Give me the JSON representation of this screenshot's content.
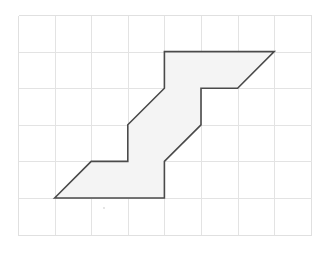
{
  "figure": {
    "canvas": {
      "width": 328,
      "height": 263,
      "background": "#ffffff"
    },
    "grid": {
      "origin_x": 18,
      "origin_y": 15,
      "cell_size": 36.6,
      "columns": 8,
      "rows": 6,
      "line_color": "#e3e3e3",
      "outer_line_color": "#e0e0e0",
      "visible": true
    },
    "shape": {
      "name": "zigzag-staircase-polygon",
      "fill_color": "#f4f4f4",
      "stroke_color": "#4a4a4a",
      "stroke_width": 1.6,
      "vertices_grid": [
        [
          1,
          5
        ],
        [
          2,
          4
        ],
        [
          3,
          4
        ],
        [
          3,
          3
        ],
        [
          4,
          2
        ],
        [
          4,
          1
        ],
        [
          7,
          1
        ],
        [
          6,
          2
        ],
        [
          5,
          2
        ],
        [
          5,
          3
        ],
        [
          4,
          4
        ],
        [
          4,
          5
        ]
      ],
      "vertex_count": 12,
      "closed": true
    },
    "marks": [
      {
        "name": "speck",
        "x": 104,
        "y": 208,
        "radius": 0.9
      }
    ]
  },
  "chart_data": {
    "type": "scatter",
    "xlabel": "",
    "ylabel": "",
    "xlim": [
      0,
      8
    ],
    "ylim": [
      0,
      6
    ],
    "grid": true,
    "legend": "none",
    "series": [
      {
        "name": "polygon-vertices",
        "x": [
          1,
          2,
          3,
          3,
          4,
          4,
          7,
          6,
          5,
          5,
          4,
          4
        ],
        "y": [
          5,
          4,
          4,
          3,
          2,
          1,
          1,
          2,
          2,
          3,
          4,
          5
        ]
      }
    ]
  }
}
